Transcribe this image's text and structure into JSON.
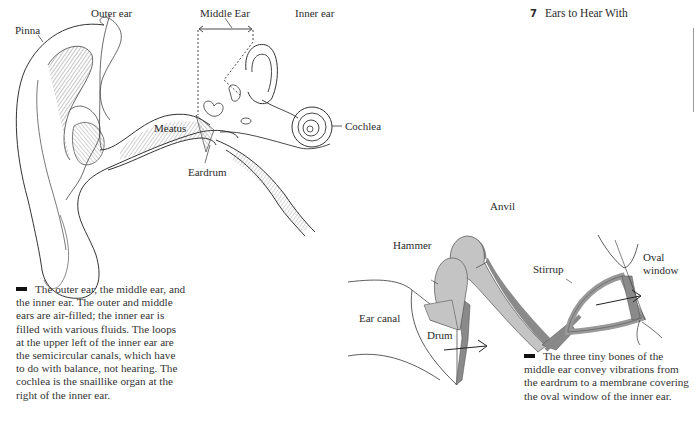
{
  "header": {
    "chapter_number": "7",
    "chapter_title": "Ears to Hear With"
  },
  "figure_ear_anatomy": {
    "labels": {
      "pinna": "Pinna",
      "outer_ear": "Outer ear",
      "middle_ear": "Middle Ear",
      "inner_ear": "Inner ear",
      "meatus": "Meatus",
      "eardrum": "Eardrum",
      "cochlea": "Cochlea"
    },
    "caption": "The outer ear, the middle ear, and the inner ear. The outer and middle ears are air-filled; the inner ear is filled with various fluids. The loops at the upper left of the inner ear are the semicircular canals, which have to do with balance, not hearing. The cochlea is the snaillike organ at the right of the inner ear."
  },
  "figure_ossicles": {
    "labels": {
      "anvil": "Anvil",
      "hammer": "Hammer",
      "stirrup": "Stirrup",
      "oval_window_line1": "Oval",
      "oval_window_line2": "window",
      "ear_canal": "Ear canal",
      "drum": "Drum"
    },
    "caption": "The three tiny bones of the middle ear convey vibrations from the eardrum to a membrane covering the oval window of the inner ear."
  },
  "colors": {
    "bone_fill": "#c4c4c4",
    "bone_shadow": "#8a8a8a",
    "ink": "#2a2a2a"
  }
}
